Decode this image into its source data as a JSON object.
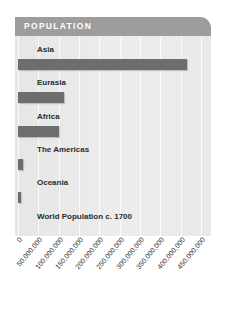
{
  "header": {
    "title": "POPULATION"
  },
  "chart_data": {
    "type": "bar",
    "orientation": "horizontal",
    "title": "POPULATION",
    "xlabel": "",
    "ylabel": "",
    "categories": [
      "Asia",
      "Eurasia",
      "Africa",
      "The Americas",
      "Oceania",
      "World Population c. 1700"
    ],
    "values": [
      415000000,
      112000000,
      100000000,
      12000000,
      5000000,
      null
    ],
    "xlim": [
      0,
      450000000
    ],
    "tick_labels": [
      "0",
      "50,000,000",
      "100,000,000",
      "150,000,000",
      "200,000,000",
      "250,000,000",
      "300,000,000",
      "350,000,000",
      "400,000,000",
      "450,000,000"
    ],
    "tick_values": [
      0,
      50000000,
      100000000,
      150000000,
      200000000,
      250000000,
      300000000,
      350000000,
      400000000,
      450000000
    ],
    "grid": true,
    "legend": "none",
    "bar_color": "#6d6d6d",
    "panel_color": "#ebebeb",
    "header_color": "#9d9d9d"
  }
}
